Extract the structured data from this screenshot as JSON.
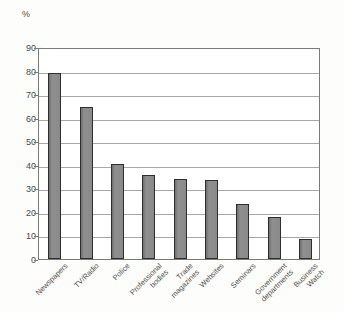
{
  "chart_data": {
    "type": "bar",
    "title": "",
    "subtitle": "",
    "xlabel": "",
    "ylabel": "%",
    "ylim": [
      0,
      90
    ],
    "ytick_step": 10,
    "yticks": [
      90,
      80,
      70,
      60,
      50,
      40,
      30,
      20,
      10,
      0
    ],
    "ytick_labels": [
      "90",
      "80",
      "70",
      "60",
      "50",
      "40",
      "30",
      "20",
      "10",
      "0"
    ],
    "grid": true,
    "legend": "none",
    "orientation": "vertical",
    "categories": [
      "Newspapers",
      "TV/Radio",
      "Police",
      "Professional\nbodies",
      "Trade\nmagazines",
      "Websites",
      "Seminars",
      "Government\ndepartments",
      "Business\nWatch"
    ],
    "values": [
      79,
      64.5,
      40.5,
      35.5,
      34,
      33.7,
      23.5,
      18,
      8.5
    ],
    "bar_color": "#8a8a8a",
    "bar_edge_color": "#2e2e2e",
    "gridline_color": "#a8a8a8",
    "axis_color": "#7a7a7a",
    "background_color": "#fdfdfc",
    "plot_background_color": "#ffffff"
  }
}
